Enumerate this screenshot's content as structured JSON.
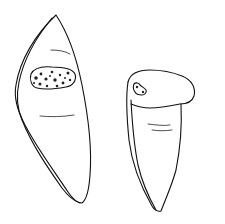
{
  "figure": {
    "objects": [
      {
        "id": "left-object",
        "shape": "elongated leaf/lens shape with dotted patch"
      },
      {
        "id": "right-object",
        "shape": "tooth-like shape with rounded cap and small spotted mark"
      }
    ],
    "colors": {
      "background": "#ffffff",
      "line": "#111111",
      "patch": "#222222"
    }
  }
}
